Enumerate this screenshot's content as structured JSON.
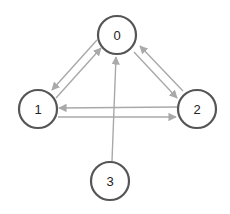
{
  "diagram": {
    "type": "directed-graph",
    "colors": {
      "node_stroke": "#555555",
      "node_fill": "#ffffff",
      "edge": "#a9a9a9",
      "label": "#222222"
    },
    "nodes": [
      {
        "id": "0",
        "label": "0",
        "cx": 117,
        "cy": 35,
        "r": 19
      },
      {
        "id": "1",
        "label": "1",
        "cx": 38,
        "cy": 109,
        "r": 19
      },
      {
        "id": "2",
        "label": "2",
        "cx": 197,
        "cy": 109,
        "r": 19
      },
      {
        "id": "3",
        "label": "3",
        "cx": 110,
        "cy": 181,
        "r": 19
      }
    ],
    "edges": [
      {
        "from": "0",
        "to": "1",
        "x1": 97,
        "y1": 40,
        "x2": 52,
        "y2": 90
      },
      {
        "from": "1",
        "to": "0",
        "x1": 56,
        "y1": 98,
        "x2": 101,
        "y2": 48
      },
      {
        "from": "0",
        "to": "2",
        "x1": 134,
        "y1": 52,
        "x2": 177,
        "y2": 98
      },
      {
        "from": "2",
        "to": "0",
        "x1": 183,
        "y1": 91,
        "x2": 140,
        "y2": 46
      },
      {
        "from": "2",
        "to": "1",
        "x1": 177,
        "y1": 107,
        "x2": 59,
        "y2": 108
      },
      {
        "from": "1",
        "to": "2",
        "x1": 58,
        "y1": 117,
        "x2": 176,
        "y2": 117
      },
      {
        "from": "3",
        "to": "0",
        "x1": 112,
        "y1": 161,
        "x2": 116,
        "y2": 57
      }
    ]
  }
}
